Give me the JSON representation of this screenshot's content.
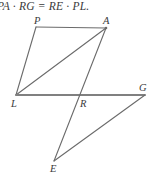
{
  "figure": {
    "caption": "PA · RG = RE · PL.",
    "type": "geometry-diagram",
    "colors": {
      "stroke": "#6b6b6b",
      "baseline_stroke": "#808080",
      "text": "#3a3a3a",
      "background": "#ffffff"
    },
    "points": {
      "P": {
        "label": "P",
        "x": 36,
        "y": 27,
        "label_x": 34,
        "label_y": 16
      },
      "A": {
        "label": "A",
        "x": 106,
        "y": 28,
        "label_x": 103,
        "label_y": 16
      },
      "L": {
        "label": "L",
        "x": 16,
        "y": 95,
        "label_x": 11,
        "label_y": 99
      },
      "R": {
        "label": "R",
        "x": 77,
        "y": 96,
        "label_x": 80,
        "label_y": 99
      },
      "G": {
        "label": "G",
        "x": 145,
        "y": 95,
        "label_x": 139,
        "label_y": 83
      },
      "E": {
        "label": "E",
        "x": 54,
        "y": 161,
        "label_x": 50,
        "label_y": 164
      }
    },
    "segments": [
      {
        "name": "segment-PA",
        "from": "P",
        "to": "A",
        "weight": 1.1
      },
      {
        "name": "segment-PL",
        "from": "P",
        "to": "L",
        "weight": 1.1
      },
      {
        "name": "segment-LA-diagonal",
        "from": "L",
        "to": "A",
        "weight": 1.1
      },
      {
        "name": "segment-LG-baseline",
        "from": "L",
        "to": "G",
        "weight": 1.9
      },
      {
        "name": "segment-AE",
        "from": "A",
        "to": "E",
        "weight": 1.1
      },
      {
        "name": "segment-EG",
        "from": "E",
        "to": "G",
        "weight": 1.1
      }
    ]
  }
}
